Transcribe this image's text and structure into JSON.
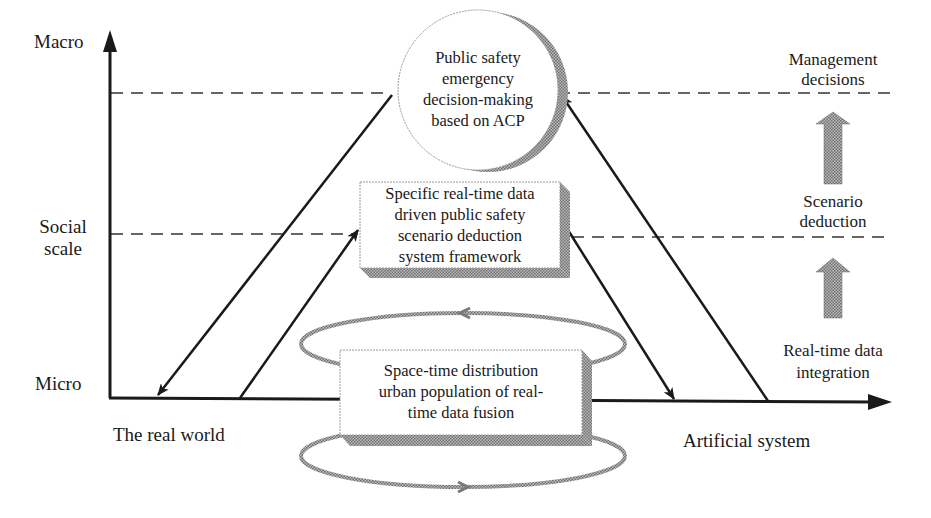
{
  "axes": {
    "y_top_label": "Macro",
    "y_mid_label": [
      "Social",
      "scale"
    ],
    "y_bottom_label": "Micro",
    "x_left_label": "The real world",
    "x_right_label": "Artificial system"
  },
  "nodes": {
    "top": {
      "shape": "circle",
      "lines": [
        "Public safety",
        "emergency",
        "decision-making",
        "based on ACP"
      ]
    },
    "middle": {
      "shape": "3d-box",
      "lines": [
        "Specific real-time data",
        "driven public safety",
        "scenario deduction",
        "system framework"
      ]
    },
    "bottom": {
      "shape": "3d-box-with-loops",
      "lines": [
        "Space-time distribution",
        "urban population of real-",
        "time data fusion"
      ]
    }
  },
  "right_stages": {
    "top": [
      "Management",
      "decisions"
    ],
    "middle": [
      "Scenario",
      "deduction"
    ],
    "bottom": [
      "Real-time data",
      "integration"
    ]
  },
  "colors": {
    "line": "#1a1a1a",
    "hatch": "#8a8a8a",
    "dashed": "#333333",
    "node_border": "#9a9a9a"
  }
}
